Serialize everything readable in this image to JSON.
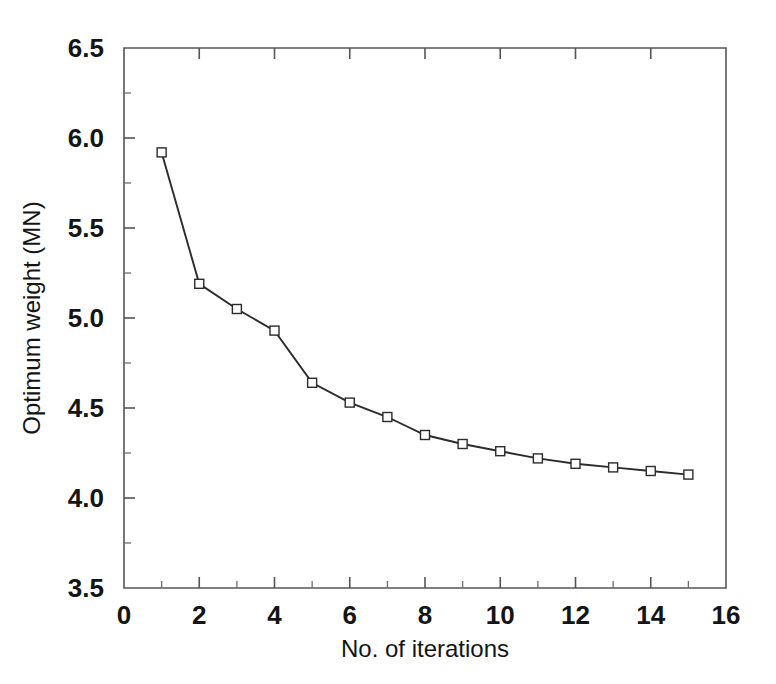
{
  "chart_data": {
    "type": "line",
    "title": "",
    "xlabel": "No. of iterations",
    "ylabel": "Optimum weight (MN)",
    "xlim": [
      0,
      16
    ],
    "ylim": [
      3.5,
      6.5
    ],
    "grid": false,
    "legend": null,
    "x_ticks": [
      0,
      2,
      4,
      6,
      8,
      10,
      12,
      14,
      16
    ],
    "x_tick_labels": [
      "0",
      "2",
      "4",
      "6",
      "8",
      "10",
      "12",
      "14",
      "16"
    ],
    "x_minor_tick_step": 1,
    "y_ticks": [
      3.5,
      4.0,
      4.5,
      5.0,
      5.5,
      6.0,
      6.5
    ],
    "y_tick_labels": [
      "3.5",
      "4.0",
      "4.5",
      "5.0",
      "5.5",
      "6.0",
      "6.5"
    ],
    "y_minor_tick_step": 0.25,
    "marker": "open-square",
    "line_color": "#2b2b2b",
    "marker_face_color": "#ffffff",
    "marker_edge_color": "#2b2b2b",
    "background_color": "#ffffff",
    "x": [
      1,
      2,
      3,
      4,
      5,
      6,
      7,
      8,
      9,
      10,
      11,
      12,
      13,
      14,
      15
    ],
    "values": [
      5.92,
      5.19,
      5.05,
      4.93,
      4.64,
      4.53,
      4.45,
      4.35,
      4.3,
      4.26,
      4.22,
      4.19,
      4.17,
      4.15,
      4.13
    ],
    "series": [
      {
        "name": "Optimum weight",
        "x": [
          1,
          2,
          3,
          4,
          5,
          6,
          7,
          8,
          9,
          10,
          11,
          12,
          13,
          14,
          15
        ],
        "values": [
          5.92,
          5.19,
          5.05,
          4.93,
          4.64,
          4.53,
          4.45,
          4.35,
          4.3,
          4.26,
          4.22,
          4.19,
          4.17,
          4.15,
          4.13
        ]
      }
    ]
  }
}
